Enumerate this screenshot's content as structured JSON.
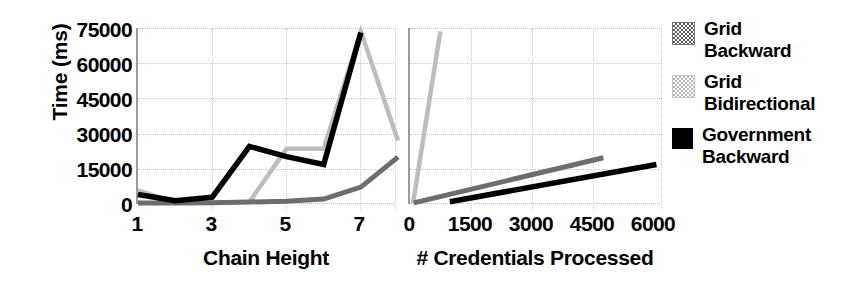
{
  "chart_data": {
    "type": "line",
    "title": "",
    "panels": [
      {
        "id": "chain-height",
        "xlabel": "Chain Height",
        "ylabel": "Time (ms)",
        "xticks": [
          "1",
          "3",
          "5",
          "7"
        ],
        "xtick_values": [
          1,
          3,
          5,
          7
        ],
        "xlim": [
          1,
          8
        ],
        "yticks": [
          "0",
          "15000",
          "30000",
          "45000",
          "60000",
          "75000"
        ],
        "ytick_values": [
          0,
          15000,
          30000,
          45000,
          60000,
          75000
        ],
        "ylim": [
          0,
          78000
        ],
        "grid": true,
        "series": [
          {
            "name": "Grid Backward",
            "color": "#6d6d6d",
            "x": [
              1,
              2,
              3,
              4,
              5,
              6,
              7,
              8
            ],
            "values": [
              400,
              450,
              600,
              900,
              1200,
              2200,
              7500,
              20800
            ]
          },
          {
            "name": "Grid Bidirectional",
            "color": "#bdbdbd",
            "x": [
              1,
              2,
              3,
              4,
              5,
              6,
              7,
              8
            ],
            "values": [
              6000,
              700,
              700,
              900,
              24500,
              24500,
              76500,
              28000
            ]
          },
          {
            "name": "Government Backward",
            "color": "#000000",
            "x": [
              1,
              2,
              3,
              4,
              5,
              6,
              7
            ],
            "values": [
              4200,
              1500,
              3000,
              25500,
              21000,
              17500,
              76000
            ]
          }
        ]
      },
      {
        "id": "credentials-processed",
        "xlabel": "# Credentials Processed",
        "ylabel": "Time (ms)",
        "xticks": [
          "0",
          "1500",
          "3000",
          "4500",
          "6000"
        ],
        "xtick_values": [
          0,
          1500,
          3000,
          4500,
          6000
        ],
        "xlim": [
          0,
          6700
        ],
        "yticks": [
          "0",
          "15000",
          "30000",
          "45000",
          "60000",
          "75000"
        ],
        "ytick_values": [
          0,
          15000,
          30000,
          45000,
          60000,
          75000
        ],
        "ylim": [
          0,
          78000
        ],
        "grid": true,
        "series": [
          {
            "name": "Grid Bidirectional",
            "color": "#bdbdbd",
            "x": [
              80,
              800
            ],
            "values": [
              400,
              76500
            ]
          },
          {
            "name": "Grid Backward",
            "color": "#6d6d6d",
            "x": [
              100,
              5100
            ],
            "values": [
              500,
              20500
            ]
          },
          {
            "name": "Government Backward",
            "color": "#000000",
            "x": [
              1050,
              6500
            ],
            "values": [
              1000,
              17500
            ]
          }
        ]
      }
    ],
    "legend": {
      "position": "right",
      "entries": [
        {
          "label_line1": "Grid",
          "label_line2": "Backward",
          "swatch": "grid-backward",
          "color": "#6d6d6d"
        },
        {
          "label_line1": "Grid",
          "label_line2": "Bidirectional",
          "swatch": "grid-bidirectional",
          "color": "#bdbdbd"
        },
        {
          "label_line1": "Government",
          "label_line2": "Backward",
          "swatch": "government-backward",
          "color": "#000000"
        }
      ]
    }
  },
  "axes": {
    "ylabel": "Time (ms)",
    "yticks": [
      {
        "label": "75000",
        "top": 19
      },
      {
        "label": "60000",
        "top": 54
      },
      {
        "label": "45000",
        "top": 89
      },
      {
        "label": "30000",
        "top": 124
      },
      {
        "label": "15000",
        "top": 159
      },
      {
        "label": "0",
        "top": 194
      }
    ]
  },
  "left_panel": {
    "xlabel": "Chain Height",
    "xticks": [
      {
        "label": "1",
        "x": 137
      },
      {
        "label": "3",
        "x": 211
      },
      {
        "label": "5",
        "x": 285
      },
      {
        "label": "7",
        "x": 359
      }
    ]
  },
  "right_panel": {
    "xlabel": "# Credentials Processed",
    "xticks": [
      {
        "label": "0",
        "x": 409
      },
      {
        "label": "1500",
        "x": 470
      },
      {
        "label": "3000",
        "x": 531
      },
      {
        "label": "4500",
        "x": 592
      },
      {
        "label": "6000",
        "x": 653
      }
    ]
  },
  "legend": {
    "entries": [
      {
        "line1": "Grid",
        "line2": "Backward"
      },
      {
        "line1": "Grid",
        "line2": "Bidirectional"
      },
      {
        "line1": "Government",
        "line2": "Backward"
      }
    ]
  }
}
